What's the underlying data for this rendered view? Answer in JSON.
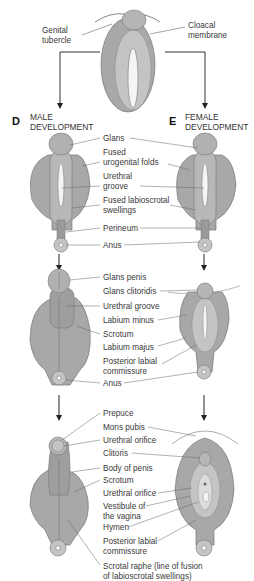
{
  "diagram": {
    "colors": {
      "tissue_dark": "#8c8c8c",
      "tissue_mid": "#a8a8a8",
      "tissue_light": "#c4c4c4",
      "groove": "#f2f2f2",
      "line": "#555555"
    },
    "top_stage": {
      "labels": {
        "genital_tubercle": "Genital\ntubercle",
        "cloacal_membrane": "Cloacal\nmembrane"
      }
    },
    "panels": {
      "male": {
        "letter": "D",
        "heading": "MALE\nDEVELOPMENT"
      },
      "female": {
        "letter": "E",
        "heading": "FEMALE\nDEVELOPMENT"
      }
    },
    "stage1_labels": [
      "Glans",
      "Fused\nurogenital folds",
      "Urethral\ngroove",
      "Fused labioscrotal\nswellings",
      "Perineum",
      "Anus"
    ],
    "stage2_labels": [
      "Glans penis",
      "Glans clitoridis",
      "Urethral groove",
      "Labium minus",
      "Scrotum",
      "Labium majus",
      "Posterior labial\ncommissure",
      "Anus"
    ],
    "stage3_labels": [
      "Prepuce",
      "Mons pubis",
      "Urethral orifice",
      "Clitoris",
      "Body of penis",
      "Scrotum",
      "Urethral orifice",
      "Vestibule of\nthe vagina",
      "Hymen",
      "Posterior labial\ncommissure",
      "Scrotal raphe (line of fusion\nof labioscrotal swellings)"
    ]
  }
}
